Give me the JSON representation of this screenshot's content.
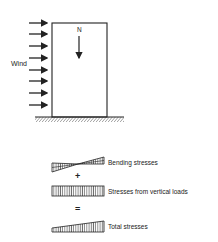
{
  "diagram": {
    "wind_label": "Wind",
    "load_label": "N",
    "stress_rows": [
      {
        "label": "Bending stresses"
      },
      {
        "label": "Stresses from vertical loads"
      },
      {
        "label": "Total stresses"
      }
    ],
    "operators": [
      "+",
      "="
    ]
  }
}
